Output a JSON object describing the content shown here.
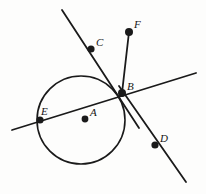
{
  "figure": {
    "kind": "circle-tangent-secant-geometry-diagram",
    "width": 206,
    "height": 194,
    "background_color": "#fdfdfc",
    "ink_color": "#1a1a1a"
  },
  "circle": {
    "name": "circle-A",
    "center_label": "A",
    "cx": 81,
    "cy": 120,
    "r": 44,
    "stroke_color": "#1a1a1a",
    "stroke_width": 1.6,
    "fill": "none"
  },
  "lines": [
    {
      "name": "line-C-through-B",
      "label": "CB",
      "x1": 62,
      "y1": 10,
      "x2": 139,
      "y2": 128,
      "stroke_width": 1.8
    },
    {
      "name": "line-E-B-secant",
      "label": "EB",
      "x1": 12,
      "y1": 130,
      "x2": 196,
      "y2": 73,
      "stroke_width": 1.8
    },
    {
      "name": "line-B-D",
      "label": "BD",
      "x1": 119,
      "y1": 86,
      "x2": 186,
      "y2": 182,
      "stroke_width": 1.8
    },
    {
      "name": "segment-F-B",
      "label": "FB",
      "x1": 129,
      "y1": 32,
      "x2": 122,
      "y2": 93,
      "stroke_width": 1.8
    }
  ],
  "points": [
    {
      "name": "point-A",
      "label": "A",
      "x": 85,
      "y": 119,
      "r": 3.4,
      "label_x": 90,
      "label_y": 107
    },
    {
      "name": "point-B",
      "label": "B",
      "x": 122,
      "y": 93,
      "r": 4.0,
      "label_x": 127,
      "label_y": 81
    },
    {
      "name": "point-C",
      "label": "C",
      "x": 91,
      "y": 49,
      "r": 3.6,
      "label_x": 96,
      "label_y": 37
    },
    {
      "name": "point-D",
      "label": "D",
      "x": 155,
      "y": 145,
      "r": 3.6,
      "label_x": 160,
      "label_y": 133
    },
    {
      "name": "point-E",
      "label": "E",
      "x": 40,
      "y": 120,
      "r": 3.6,
      "label_x": 41,
      "label_y": 106
    },
    {
      "name": "point-F",
      "label": "F",
      "x": 129,
      "y": 32,
      "r": 4.0,
      "label_x": 134,
      "label_y": 19
    }
  ]
}
